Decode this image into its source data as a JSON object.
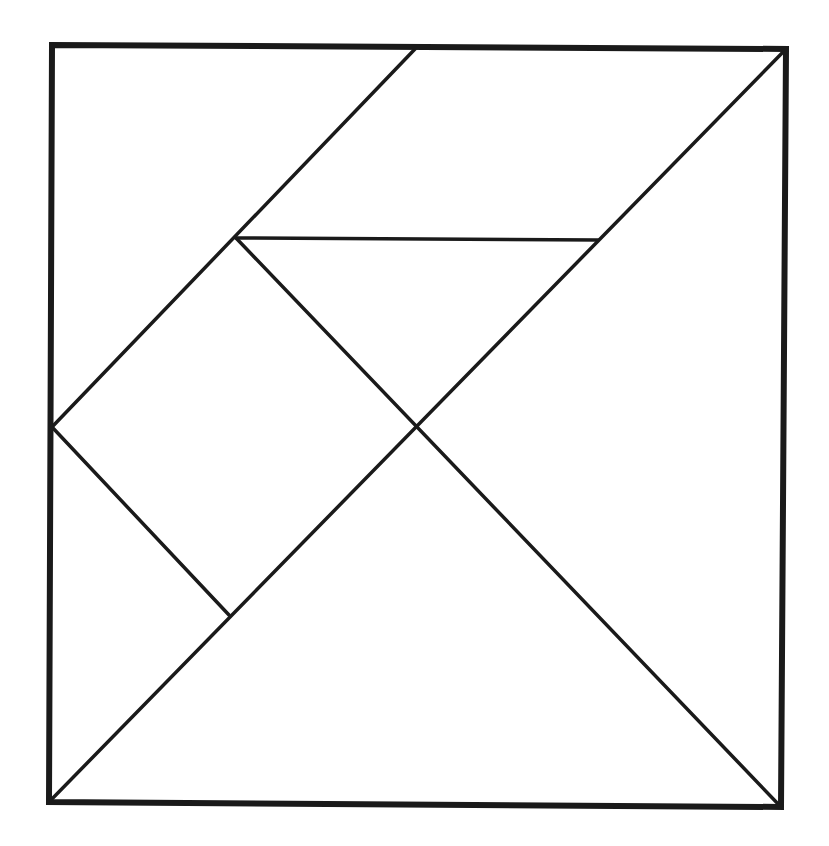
{
  "diagram": {
    "type": "tangram",
    "background": "#ffffff",
    "stroke_color": "#1a1a1a",
    "frame": {
      "corners": [
        [
          52,
          45
        ],
        [
          786,
          49
        ],
        [
          781,
          807
        ],
        [
          49,
          802
        ]
      ]
    },
    "vertices": {
      "top_mid": [
        415,
        49
      ],
      "upper_left_mid": [
        236,
        238
      ],
      "upper_right_mid": [
        598,
        240
      ],
      "center": [
        415,
        428
      ],
      "left_mid": [
        52,
        427
      ],
      "lower_left": [
        229,
        615
      ],
      "top_right": [
        786,
        49
      ],
      "bottom_left": [
        49,
        802
      ],
      "bottom_right": [
        781,
        807
      ]
    },
    "edges": [
      {
        "name": "main-diagonal",
        "from": [
          786,
          49
        ],
        "to": [
          49,
          802
        ]
      },
      {
        "name": "parallelogram-left-edge",
        "from": [
          415,
          49
        ],
        "to": [
          52,
          427
        ]
      },
      {
        "name": "parallelogram-bottom-edge",
        "from": [
          236,
          238
        ],
        "to": [
          598,
          240
        ]
      },
      {
        "name": "center-to-bottom-right",
        "from": [
          236,
          238
        ],
        "to": [
          781,
          807
        ]
      },
      {
        "name": "square-lower-edge",
        "from": [
          52,
          427
        ],
        "to": [
          229,
          615
        ]
      }
    ],
    "pieces": [
      {
        "name": "large-triangle-bottom",
        "points": [
          [
            49,
            802
          ],
          [
            415,
            428
          ],
          [
            781,
            807
          ]
        ]
      },
      {
        "name": "large-triangle-right",
        "points": [
          [
            786,
            49
          ],
          [
            415,
            428
          ],
          [
            781,
            807
          ]
        ]
      },
      {
        "name": "parallelogram-top",
        "points": [
          [
            415,
            49
          ],
          [
            786,
            49
          ],
          [
            598,
            240
          ],
          [
            236,
            238
          ]
        ]
      },
      {
        "name": "medium-triangle-top-left",
        "points": [
          [
            52,
            45
          ],
          [
            415,
            49
          ],
          [
            52,
            427
          ]
        ]
      },
      {
        "name": "small-triangle-middle",
        "points": [
          [
            236,
            238
          ],
          [
            598,
            240
          ],
          [
            415,
            428
          ]
        ]
      },
      {
        "name": "square-middle-left",
        "points": [
          [
            236,
            238
          ],
          [
            415,
            428
          ],
          [
            229,
            615
          ],
          [
            52,
            427
          ]
        ]
      },
      {
        "name": "small-triangle-bottom-left",
        "points": [
          [
            52,
            427
          ],
          [
            229,
            615
          ],
          [
            49,
            802
          ]
        ]
      }
    ]
  }
}
